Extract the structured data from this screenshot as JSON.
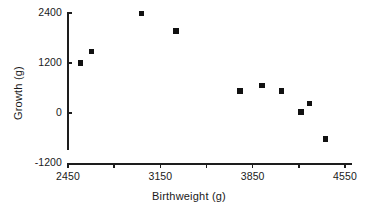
{
  "chart_data": {
    "type": "scatter",
    "title": "",
    "xlabel": "Birthweight (g)",
    "ylabel": "Growth (g)",
    "xlim": [
      2450,
      4920
    ],
    "ylim": [
      -1200,
      2400
    ],
    "grid": false,
    "legend": null,
    "xticks": [
      2450,
      3150,
      3850,
      4550
    ],
    "xtick_labels": [
      "2450",
      "3150",
      "3850",
      "4550"
    ],
    "xminor_ticks": [
      2800,
      3500,
      4200,
      4900
    ],
    "yticks": [
      -1200,
      0,
      1200,
      2400
    ],
    "ytick_labels": [
      "-1200",
      "0",
      "1200",
      "2400"
    ],
    "marker": "square",
    "marker_color": "#111111",
    "points": [
      {
        "x": 2545,
        "y": 1200
      },
      {
        "x": 2630,
        "y": 1480
      },
      {
        "x": 3005,
        "y": 2390
      },
      {
        "x": 3270,
        "y": 1970
      },
      {
        "x": 3755,
        "y": 530
      },
      {
        "x": 3920,
        "y": 660
      },
      {
        "x": 4070,
        "y": 530
      },
      {
        "x": 4215,
        "y": 25
      },
      {
        "x": 4280,
        "y": 235
      },
      {
        "x": 4400,
        "y": -620
      }
    ]
  },
  "axes_pixels": {
    "x0_px": 68,
    "x1_px": 345,
    "x0_val": 2450,
    "x1_val": 4550,
    "y0_px": 163,
    "y1_px": 13,
    "y0_val": -1200,
    "y1_val": 2400,
    "xspine_left_px": 68,
    "xspine_right_px": 352,
    "yspine_top_px": 13,
    "yspine_bottom_px": 150
  }
}
